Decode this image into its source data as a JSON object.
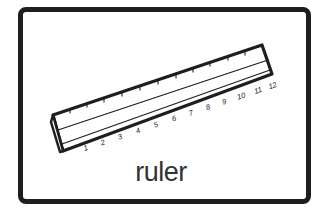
{
  "card": {
    "label": "ruler",
    "illustration": "ruler-icon",
    "border_color": "#1e1e1e"
  },
  "ruler": {
    "numbers": [
      "1",
      "2",
      "3",
      "4",
      "5",
      "6",
      "7",
      "8",
      "9",
      "10",
      "11",
      "12"
    ]
  }
}
